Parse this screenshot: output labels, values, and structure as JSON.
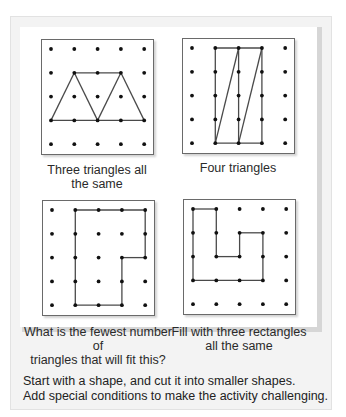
{
  "activities": [
    {
      "caption_line1": "Three triangles all",
      "caption_line2": "the same",
      "shape": "trapezoid split into three identical triangles",
      "grid": "5x5 dot grid",
      "lines": [
        [
          0,
          3,
          1,
          1
        ],
        [
          1,
          1,
          3,
          1
        ],
        [
          3,
          1,
          4,
          3
        ],
        [
          0,
          3,
          4,
          3
        ],
        [
          1,
          1,
          2,
          3
        ],
        [
          2,
          3,
          3,
          1
        ]
      ]
    },
    {
      "caption_line1": "Four triangles",
      "caption_line2": "",
      "shape": "rectangle split into four triangles",
      "grid": "5x5 dot grid",
      "lines": [
        [
          1,
          0,
          3,
          0
        ],
        [
          1,
          0,
          1,
          4
        ],
        [
          3,
          0,
          3,
          4
        ],
        [
          1,
          4,
          3,
          4
        ],
        [
          2,
          0,
          2,
          4
        ],
        [
          1,
          4,
          2,
          0
        ],
        [
          2,
          4,
          3,
          0
        ]
      ]
    },
    {
      "caption_line1": "What is the fewest number of",
      "caption_line2": "triangles that will fit this?",
      "shape": "L-shaped polygon",
      "grid": "5x5 dot grid",
      "lines": [
        [
          1,
          0,
          4,
          0
        ],
        [
          4,
          0,
          4,
          2
        ],
        [
          4,
          2,
          3,
          2
        ],
        [
          3,
          2,
          3,
          4
        ],
        [
          3,
          4,
          1,
          4
        ],
        [
          1,
          4,
          1,
          0
        ]
      ]
    },
    {
      "caption_line1": "Fill with three rectangles",
      "caption_line2": "all the same",
      "shape": "U-shaped polygon",
      "grid": "5x5 dot grid",
      "lines": [
        [
          0,
          0,
          1,
          0
        ],
        [
          1,
          0,
          1,
          2
        ],
        [
          1,
          2,
          2,
          2
        ],
        [
          2,
          2,
          2,
          1
        ],
        [
          2,
          1,
          3,
          1
        ],
        [
          3,
          1,
          3,
          3
        ],
        [
          3,
          3,
          0,
          3
        ],
        [
          0,
          3,
          0,
          0
        ]
      ]
    }
  ],
  "footer": {
    "line1": "Start with a shape, and cut it into smaller shapes.",
    "line2": "Add special conditions to make the activity challenging."
  },
  "colors": {
    "panel_bg": "#f3f3f3",
    "line": "#4a4a4a",
    "dot": "#111111",
    "shadow": "#d6d6d6"
  }
}
